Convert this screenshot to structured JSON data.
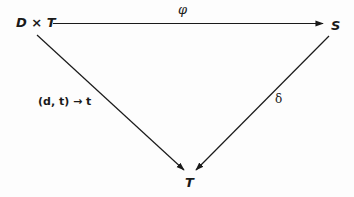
{
  "diagram": {
    "type": "commutative-diagram",
    "nodes": {
      "product": {
        "label": "D × T"
      },
      "target": {
        "label": "S"
      },
      "bottom": {
        "label": "T"
      }
    },
    "arrows": {
      "top": {
        "from": "D × T",
        "to": "S",
        "label": "φ"
      },
      "left": {
        "from": "D × T",
        "to": "T",
        "label": "(d, t) → t"
      },
      "right": {
        "from": "S",
        "to": "T",
        "label": "δ"
      }
    },
    "colors": {
      "ink": "#1a1a1a",
      "background": "#fdfdfd"
    }
  }
}
